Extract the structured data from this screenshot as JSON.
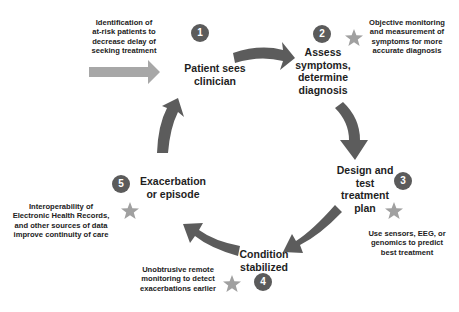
{
  "diagram": {
    "type": "cycle",
    "colors": {
      "arrow": "#5c5c5c",
      "entry_arrow": "#a7a7a7",
      "step_circle": "#5b5b5b",
      "star": "#a0a0a0",
      "text": "#1e1e1e"
    },
    "entry_note": "Identification of at-risk patients to decrease delay of seeking treatment",
    "steps": [
      {
        "number": "1",
        "label_lines": [
          "Patient sees",
          "clinician"
        ]
      },
      {
        "number": "2",
        "label_lines": [
          "Assess",
          "symptoms,",
          "determine",
          "diagnosis"
        ]
      },
      {
        "number": "3",
        "label_lines": [
          "Design and",
          "test",
          "treatment",
          "plan"
        ]
      },
      {
        "number": "4",
        "label_lines": [
          "Condition",
          "stabilized"
        ]
      },
      {
        "number": "5",
        "label_lines": [
          "Exacerbation",
          "or episode"
        ]
      }
    ],
    "notes": {
      "entry": [
        "Identification of",
        "at-risk patients to",
        "decrease delay of",
        "seeking treatment"
      ],
      "step2": [
        "Objective monitoring",
        "and measurement of",
        "symptoms for more",
        "accurate diagnosis"
      ],
      "step3": [
        "Use sensors, EEG, or",
        "genomics to predict",
        "best treatment"
      ],
      "step4": [
        "Unobtrusive remote",
        "monitoring to detect",
        "exacerbations earlier"
      ],
      "step5": [
        "Interoperability of",
        "Electronic Health Records,",
        "and other sources of data",
        "improve continuity of care"
      ]
    },
    "icons": {
      "star": "star-icon",
      "arrow": "curved-arrow-icon"
    }
  }
}
